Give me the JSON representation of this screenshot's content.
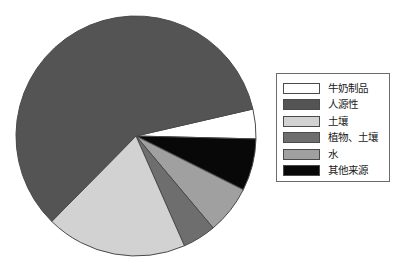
{
  "chart_data": {
    "type": "pie",
    "title": "",
    "xlabel": "",
    "ylabel": "",
    "legend_position": "right",
    "grid": false,
    "start_angle_deg": -13,
    "direction": "clockwise",
    "center": {
      "x": 136,
      "y": 136
    },
    "radius": 120,
    "categories": [
      "牛奶制品",
      "人源性",
      "土壤",
      "植物、土壤",
      "水",
      "其他来源"
    ],
    "values": [
      4.0,
      59.0,
      19.0,
      4.5,
      6.5,
      7.0
    ],
    "colors": [
      "#ffffff",
      "#545454",
      "#d2d2d2",
      "#6e6e6e",
      "#a0a0a0",
      "#080808"
    ],
    "slices": [
      {
        "label": "牛奶制品",
        "value": 4.0,
        "color": "#ffffff",
        "start_deg": -13,
        "end_deg": 1.4
      },
      {
        "label": "其他来源",
        "value": 7.0,
        "color": "#080808",
        "start_deg": 1.4,
        "end_deg": 26.6
      },
      {
        "label": "水",
        "value": 6.5,
        "color": "#a0a0a0",
        "start_deg": 26.6,
        "end_deg": 50.0
      },
      {
        "label": "植物、土壤",
        "value": 4.5,
        "color": "#6e6e6e",
        "start_deg": 50.0,
        "end_deg": 66.2
      },
      {
        "label": "土壤",
        "value": 19.0,
        "color": "#d2d2d2",
        "start_deg": 66.2,
        "end_deg": 134.6
      },
      {
        "label": "人源性",
        "value": 59.0,
        "color": "#545454",
        "start_deg": 134.6,
        "end_deg": 347.0
      }
    ]
  },
  "legend": {
    "items": [
      {
        "label": "牛奶制品",
        "color": "#ffffff"
      },
      {
        "label": "人源性",
        "color": "#545454"
      },
      {
        "label": "土壤",
        "color": "#d2d2d2"
      },
      {
        "label": "植物、土壤",
        "color": "#6e6e6e"
      },
      {
        "label": "水",
        "color": "#a0a0a0"
      },
      {
        "label": "其他来源",
        "color": "#080808"
      }
    ]
  },
  "style": {
    "background": "#ffffff",
    "outline": "#4a4a4a",
    "legend_border": "#6b6b6b"
  }
}
